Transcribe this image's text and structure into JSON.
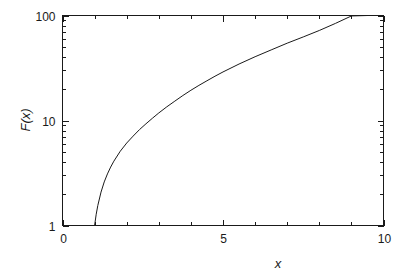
{
  "chart_data": {
    "type": "line",
    "title": "",
    "subtitle": "",
    "xlabel": "x",
    "ylabel": "F(x)",
    "xscale": "linear",
    "yscale": "log",
    "xlim": [
      0,
      10
    ],
    "ylim": [
      1,
      100
    ],
    "grid": false,
    "legend": null,
    "legend_position": "none",
    "frame": "box",
    "x_major_ticks": [
      0,
      5,
      10
    ],
    "x_major_tick_labels": [
      "0",
      "5",
      "10"
    ],
    "x_minor_ticks": [
      1,
      2,
      3,
      4,
      6,
      7,
      8,
      9
    ],
    "y_major_ticks": [
      1,
      10,
      100
    ],
    "y_major_tick_labels": [
      "1",
      "10",
      "100"
    ],
    "y_minor_ticks": [
      2,
      3,
      4,
      5,
      6,
      7,
      8,
      9,
      20,
      30,
      40,
      50,
      60,
      70,
      80,
      90
    ],
    "series": [
      {
        "name": "F(x)",
        "color": "#1a1a1a",
        "linewidth": 1,
        "x": [
          1.0,
          1.05,
          1.1,
          1.2,
          1.3,
          1.4,
          1.5,
          1.6,
          1.8,
          2.0,
          2.2,
          2.4,
          2.6,
          2.8,
          3.0,
          3.25,
          3.5,
          3.75,
          4.0,
          4.25,
          4.5,
          4.75,
          5.0,
          5.5,
          6.0,
          6.5,
          7.0,
          7.5,
          8.0,
          8.5,
          9.0,
          9.5,
          10.0
        ],
        "y": [
          1.0,
          1.28,
          1.55,
          2.08,
          2.6,
          3.1,
          3.6,
          4.1,
          5.1,
          6.1,
          7.1,
          8.2,
          9.3,
          10.5,
          11.8,
          13.5,
          15.3,
          17.3,
          19.4,
          21.6,
          23.9,
          26.4,
          29.0,
          34.5,
          40.5,
          47.0,
          54.5,
          62.5,
          72.0,
          84.0,
          99.0,
          100.0,
          100.0
        ]
      }
    ],
    "annotations": []
  },
  "axes": {
    "y_label_text": "F(x)",
    "x_label_text": "x"
  },
  "colors": {
    "background": "#ffffff",
    "ink": "#1a1a1a",
    "curve": "#1a1a1a"
  }
}
